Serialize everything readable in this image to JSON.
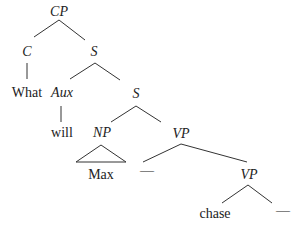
{
  "diagram": {
    "type": "syntax-tree",
    "nodes": {
      "cp": "CP",
      "c": "C",
      "s1": "S",
      "what": "What",
      "aux": "Aux",
      "s2": "S",
      "will": "will",
      "np": "NP",
      "vp1": "VP",
      "max": "Max",
      "gap1": "—",
      "vp2": "VP",
      "chase": "chase",
      "gap2": "—"
    }
  }
}
